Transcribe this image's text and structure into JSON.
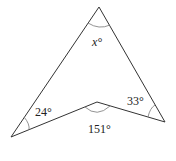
{
  "figure": {
    "type": "concave-quadrilateral-angle-problem",
    "vertices": {
      "apex": [
        99,
        7
      ],
      "bottom_left": [
        11,
        137
      ],
      "inner_notch": [
        97,
        102
      ],
      "right": [
        165,
        122
      ]
    },
    "labels": {
      "apex_angle": "x°",
      "bottom_left_angle": "24°",
      "right_angle": "33°",
      "notch_angle": "151°"
    },
    "colors": {
      "edge": "#333333",
      "arc": "#777777",
      "text": "#222222"
    }
  }
}
